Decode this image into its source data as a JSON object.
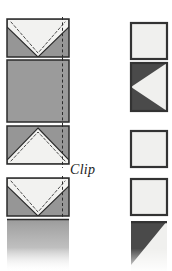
{
  "figure": {
    "label": "Clip",
    "background": "#ffffff"
  },
  "palette": {
    "fabric_gray": "#969696",
    "fabric_gray_light": "#a3a3a3",
    "dark_gray": "#4a4a4a",
    "white_fabric": "#f0f0ee",
    "outline": "#2b2b2b",
    "stitch_dash": "#3a3a3a",
    "seam_dash": "#2b2b2b"
  },
  "left_column": {
    "name": "before-clipping",
    "steps": [
      {
        "id": "step-1",
        "shape": "rectangle",
        "fill": "fabric_gray",
        "overlay": "white-inverted-v",
        "stitching": "dashed",
        "seam_line": "vertical-dashed-right",
        "x": 7,
        "y": 19,
        "w": 62,
        "h": 38
      },
      {
        "id": "step-2",
        "shape": "square",
        "fill": "fabric_gray",
        "overlay": "none",
        "stitching": "none",
        "seam_line": "vertical-dashed-right",
        "x": 7,
        "y": 60,
        "w": 62,
        "h": 62
      },
      {
        "id": "step-3",
        "shape": "rectangle",
        "fill": "fabric_gray",
        "overlay": "white-upward-triangle",
        "stitching": "dashed",
        "seam_line": "vertical-dashed-right",
        "x": 7,
        "y": 126,
        "w": 62,
        "h": 38
      },
      {
        "id": "step-4",
        "shape": "rectangle",
        "fill": "fabric_gray",
        "overlay": "white-inverted-v",
        "stitching": "dashed",
        "seam_line": "vertical-dashed-right",
        "x": 7,
        "y": 178,
        "w": 62,
        "h": 38
      },
      {
        "id": "step-5",
        "shape": "square-faded",
        "fill": "fabric_gray",
        "overlay": "none",
        "stitching": "none",
        "seam_line": "vertical-dashed-right",
        "x": 7,
        "y": 219,
        "w": 62,
        "h": 52
      }
    ]
  },
  "right_column": {
    "name": "after-clipping",
    "steps": [
      {
        "id": "result-1",
        "shape": "square",
        "fill": "white_fabric",
        "overlay": "none",
        "x": 131,
        "y": 23,
        "w": 36,
        "h": 36
      },
      {
        "id": "result-2",
        "shape": "square",
        "fill": "white_fabric",
        "overlay": "dark-left-wedges",
        "x": 131,
        "y": 63,
        "w": 36,
        "h": 48
      },
      {
        "id": "result-3",
        "shape": "square",
        "fill": "white_fabric",
        "overlay": "none",
        "x": 131,
        "y": 131,
        "w": 36,
        "h": 36
      },
      {
        "id": "result-4",
        "shape": "square",
        "fill": "white_fabric",
        "overlay": "none",
        "x": 131,
        "y": 179,
        "w": 36,
        "h": 36
      },
      {
        "id": "result-5",
        "shape": "square-faded",
        "fill": "white_fabric",
        "overlay": "dark-top-left-triangle",
        "x": 131,
        "y": 221,
        "w": 36,
        "h": 50
      }
    ]
  }
}
